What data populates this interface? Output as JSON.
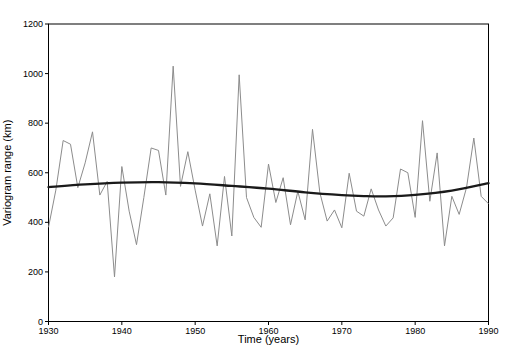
{
  "chart_data": {
    "type": "line",
    "title": "",
    "xlabel": "Time (years)",
    "ylabel": "Variogram range (km)",
    "xlim": [
      1930,
      1990
    ],
    "ylim": [
      0,
      1200
    ],
    "x_ticks": [
      1930,
      1940,
      1950,
      1960,
      1970,
      1980,
      1990
    ],
    "y_ticks": [
      0,
      200,
      400,
      600,
      800,
      1000,
      1200
    ],
    "grid": false,
    "frame": "full-box",
    "legend": "none",
    "colors": {
      "axis": "#000000",
      "series": "#8c8c8c",
      "trend": "#1a1a1a"
    },
    "x": [
      1930,
      1931,
      1932,
      1933,
      1934,
      1935,
      1936,
      1937,
      1938,
      1939,
      1940,
      1941,
      1942,
      1943,
      1944,
      1945,
      1946,
      1947,
      1948,
      1949,
      1950,
      1951,
      1952,
      1953,
      1954,
      1955,
      1956,
      1957,
      1958,
      1959,
      1960,
      1961,
      1962,
      1963,
      1964,
      1965,
      1966,
      1967,
      1968,
      1969,
      1970,
      1971,
      1972,
      1973,
      1974,
      1975,
      1976,
      1977,
      1978,
      1979,
      1980,
      1981,
      1982,
      1983,
      1984,
      1985,
      1986,
      1987,
      1988,
      1989,
      1990
    ],
    "series": [
      {
        "name": "annual variogram range",
        "style": "jagged",
        "values": [
          380,
          530,
          730,
          715,
          540,
          640,
          765,
          510,
          565,
          180,
          625,
          445,
          310,
          500,
          700,
          690,
          510,
          1030,
          545,
          685,
          530,
          385,
          515,
          305,
          585,
          345,
          995,
          500,
          420,
          380,
          635,
          480,
          580,
          390,
          525,
          410,
          775,
          520,
          405,
          450,
          378,
          598,
          445,
          425,
          535,
          450,
          385,
          418,
          615,
          600,
          420,
          810,
          485,
          680,
          305,
          505,
          432,
          540,
          740,
          505,
          475
        ]
      },
      {
        "name": "smoothed trend",
        "style": "smooth",
        "points": [
          [
            1930,
            542
          ],
          [
            1935,
            553
          ],
          [
            1940,
            560
          ],
          [
            1945,
            562
          ],
          [
            1950,
            557
          ],
          [
            1955,
            547
          ],
          [
            1960,
            536
          ],
          [
            1965,
            521
          ],
          [
            1970,
            510
          ],
          [
            1973,
            506
          ],
          [
            1976,
            505
          ],
          [
            1980,
            511
          ],
          [
            1985,
            528
          ],
          [
            1990,
            558
          ]
        ]
      }
    ]
  }
}
